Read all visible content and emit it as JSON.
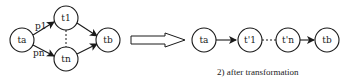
{
  "before": {
    "nodes": [
      {
        "id": "ta",
        "label": "ta"
      },
      {
        "id": "t1",
        "label": "t1"
      },
      {
        "id": "tn",
        "label": "tn"
      },
      {
        "id": "tb",
        "label": "tb"
      }
    ],
    "edge_labels": {
      "p1": "p1",
      "pn": "pn"
    }
  },
  "after": {
    "nodes": [
      {
        "id": "ta",
        "label": "ta"
      },
      {
        "id": "t1p",
        "label": "t'1"
      },
      {
        "id": "tnp",
        "label": "t'n"
      },
      {
        "id": "tb",
        "label": "tb"
      }
    ],
    "caption": "2) after transformation"
  },
  "colors": {
    "stroke": "#1a1a1a",
    "background": "#ffffff"
  }
}
